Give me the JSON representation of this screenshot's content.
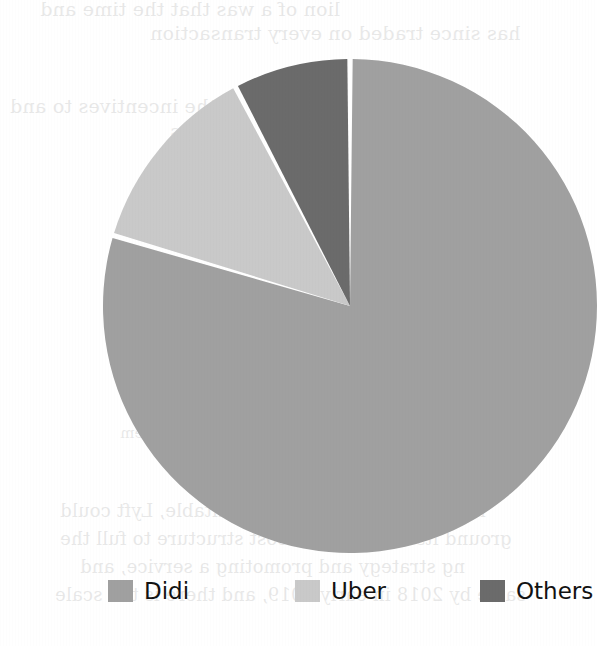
{
  "chart_data": {
    "type": "pie",
    "title": "",
    "subtitle": "",
    "xlabel": "",
    "ylabel": "",
    "grid": false,
    "legend_position": "bottom",
    "center": {
      "x": 310,
      "y": 290
    },
    "radius": 247,
    "start_angle_deg": 0,
    "slice_gap_color": "#ffffff",
    "slice_gap_width_px": 5,
    "categories": [
      "Didi",
      "Uber",
      "Others"
    ],
    "values": [
      79.6,
      12.7,
      7.7
    ],
    "units": "percent",
    "slices": [
      {
        "label": "Didi",
        "value": 79.6,
        "color": "#a0a0a0",
        "start_angle_deg": 0.0,
        "end_angle_deg": 286.6
      },
      {
        "label": "Uber",
        "value": 12.7,
        "color": "#c9c9c9",
        "start_angle_deg": 286.6,
        "end_angle_deg": 332.4
      },
      {
        "label": "Others",
        "value": 7.7,
        "color": "#6b6b6b",
        "start_angle_deg": 332.4,
        "end_angle_deg": 360.0
      }
    ]
  },
  "legend": {
    "items": [
      {
        "label": "Didi",
        "color": "#a0a0a0"
      },
      {
        "label": "Uber",
        "color": "#c9c9c9"
      },
      {
        "label": "Others",
        "color": "#6b6b6b"
      }
    ]
  },
  "background_text": {
    "note": "faint mirrored bleed-through from the reverse side of the scanned page",
    "lines": [
      {
        "text": "lion of a was that the time and",
        "x": 40,
        "y": -2,
        "size": 19
      },
      {
        "text": "has since traded on every transaction",
        "x": 150,
        "y": 22,
        "size": 19
      },
      {
        "text": "and weaken the incentives to and",
        "x": 10,
        "y": 95,
        "size": 19
      },
      {
        "text": "for drivers, driving up prices",
        "x": 170,
        "y": 120,
        "size": 19
      },
      {
        "text": "and presenting a from",
        "x": 190,
        "y": 145,
        "size": 19
      },
      {
        "text": "Bloomberg revealed",
        "x": 220,
        "y": 195,
        "size": 19
      },
      {
        "text": "down in",
        "x": 255,
        "y": 228,
        "size": 19
      },
      {
        "text": "conditions could for same",
        "x": 150,
        "y": 268,
        "size": 15
      },
      {
        "text": "the company is the been on its own",
        "x": 120,
        "y": 300,
        "size": 15
      },
      {
        "text": "a lot of it at the moment of its headlines",
        "x": 140,
        "y": 330,
        "size": 15
      },
      {
        "text": "to the future. After all, the firm must to",
        "x": 130,
        "y": 360,
        "size": 15
      },
      {
        "text": "double margins, or running a far and",
        "x": 140,
        "y": 392,
        "size": 15
      },
      {
        "text": "rivals might enable it to be charge of them",
        "x": 120,
        "y": 424,
        "size": 15
      },
      {
        "text": "ng hard its market level profitable, Lyft could",
        "x": 60,
        "y": 500,
        "size": 18
      },
      {
        "text": "ground itself in a lower cost structure to full the",
        "x": 60,
        "y": 528,
        "size": 18
      },
      {
        "text": "ng strategy and promoting a service, and",
        "x": 80,
        "y": 556,
        "size": 18
      },
      {
        "text": "same by 2018 in early 2019, and there is the scale",
        "x": 55,
        "y": 584,
        "size": 18
      }
    ]
  }
}
